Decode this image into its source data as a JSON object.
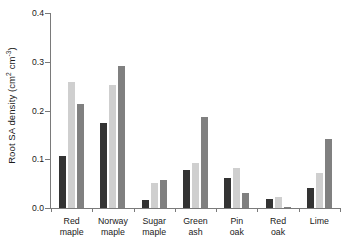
{
  "chart_data": {
    "type": "bar",
    "title": "",
    "subtitle": "",
    "xlabel": "",
    "ylabel_text": "Root SA density (cm",
    "ylabel_sup1": "2",
    "ylabel_mid": " cm",
    "ylabel_sup2": "-3",
    "ylabel_end": ")",
    "ylabel_plain": "Root SA density (cm2 cm-3)",
    "categories": [
      "Red maple",
      "Norway maple",
      "Sugar maple",
      "Green ash",
      "Pin oak",
      "Red oak",
      "Lime"
    ],
    "category_lines": [
      [
        "Red",
        "maple"
      ],
      [
        "Norway",
        "maple"
      ],
      [
        "Sugar",
        "maple"
      ],
      [
        "Green",
        "ash"
      ],
      [
        "Pin",
        "oak"
      ],
      [
        "Red",
        "oak"
      ],
      [
        "Lime"
      ]
    ],
    "series": [
      {
        "name": "series-1",
        "color": "#333333",
        "values": [
          0.107,
          0.174,
          0.017,
          0.077,
          0.062,
          0.019,
          0.042
        ]
      },
      {
        "name": "series-2",
        "color": "#cfcfcf",
        "values": [
          0.259,
          0.252,
          0.051,
          0.093,
          0.083,
          0.023,
          0.072
        ]
      },
      {
        "name": "series-3",
        "color": "#808080",
        "values": [
          0.214,
          0.292,
          0.058,
          0.186,
          0.031,
          0.003,
          0.142
        ]
      }
    ],
    "ylim": [
      0.0,
      0.4
    ],
    "ytick_labels": [
      "0.0",
      "0.1",
      "0.2",
      "0.3",
      "0.4"
    ],
    "ytick_values": [
      0.0,
      0.1,
      0.2,
      0.3,
      0.4
    ],
    "grid": false,
    "legend": false,
    "legend_position": "none",
    "axis_color": "#7a7a7a"
  }
}
